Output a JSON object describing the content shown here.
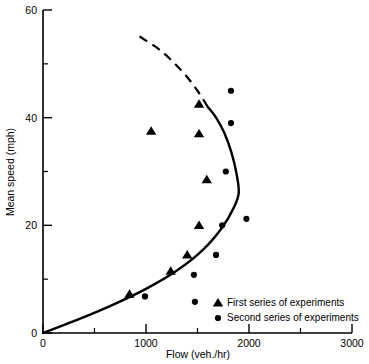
{
  "chart_data": {
    "type": "scatter",
    "title": "",
    "xlabel": "Flow (veh./hr)",
    "ylabel": "Mean speed (mph)",
    "xlim": [
      0,
      3000
    ],
    "ylim": [
      0,
      60
    ],
    "xticks": [
      0,
      1000,
      2000,
      3000
    ],
    "xticklabels": [
      "0",
      "1000",
      "2000",
      "3000"
    ],
    "xticks_minor": [
      500,
      1500,
      2500
    ],
    "yticks": [
      0,
      20,
      40,
      60
    ],
    "yticklabels": [
      "0",
      "20",
      "40",
      "60"
    ],
    "yticks_minor": [
      10,
      30,
      50
    ],
    "grid": false,
    "legend_position": "lower right",
    "series": [
      {
        "name": "First series of experiments",
        "marker": "triangle",
        "color": "#000000",
        "points": [
          {
            "x": 840,
            "y": 7.2
          },
          {
            "x": 1240,
            "y": 11.5
          },
          {
            "x": 1400,
            "y": 14.5
          },
          {
            "x": 1050,
            "y": 37.5
          },
          {
            "x": 1515,
            "y": 20.0
          },
          {
            "x": 1590,
            "y": 28.5
          },
          {
            "x": 1515,
            "y": 42.5
          },
          {
            "x": 1515,
            "y": 37.0
          }
        ]
      },
      {
        "name": "Second series of experiments",
        "marker": "circle",
        "color": "#000000",
        "points": [
          {
            "x": 990,
            "y": 6.8
          },
          {
            "x": 1465,
            "y": 10.8
          },
          {
            "x": 1680,
            "y": 14.5
          },
          {
            "x": 1740,
            "y": 20.0
          },
          {
            "x": 1975,
            "y": 21.2
          },
          {
            "x": 1775,
            "y": 30.0
          },
          {
            "x": 1825,
            "y": 39.0
          },
          {
            "x": 1825,
            "y": 45.0
          },
          {
            "x": 1475,
            "y": 5.8
          }
        ]
      }
    ],
    "fitted_curve": {
      "style_lower": "solid",
      "style_upper": "dashed",
      "dash_transition_speed": 42,
      "description": "Backward-bending speed-flow curve; capacity nose near 1900 veh./hr at 26 mph"
    }
  },
  "legend": {
    "entries": [
      {
        "marker": "triangle",
        "label": "First series of experiments"
      },
      {
        "marker": "circle",
        "label": "Second series of experiments"
      }
    ]
  },
  "axes": {
    "x_title": "Flow (veh./hr)",
    "y_title": "Mean speed (mph)"
  }
}
